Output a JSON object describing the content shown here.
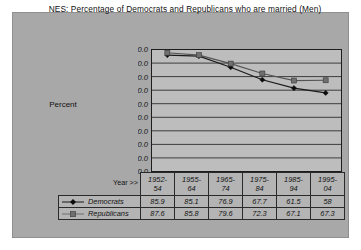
{
  "chart_data": {
    "type": "line",
    "title": "NES:  Percentage of Democrats and Republicans who are married (Men)",
    "xlabel": "Year >>",
    "ylabel": "Percent",
    "categories": [
      "1952-54",
      "1955-64",
      "1965-74",
      "1975-84",
      "1985-94",
      "1995-04"
    ],
    "category_lines": [
      [
        "1952-",
        "54"
      ],
      [
        "1955-",
        "64"
      ],
      [
        "1965-",
        "74"
      ],
      [
        "1975-",
        "84"
      ],
      [
        "1985-",
        "94"
      ],
      [
        "1995-",
        "04"
      ]
    ],
    "series": [
      {
        "name": "Democrats",
        "values": [
          85.9,
          85.1,
          76.9,
          67.7,
          61.5,
          58.0
        ],
        "color": "#1a1a1a",
        "marker": "diamond"
      },
      {
        "name": "Republicans",
        "values": [
          87.6,
          85.8,
          79.6,
          72.3,
          67.1,
          67.3
        ],
        "color": "#6f6f6f",
        "marker": "square"
      }
    ],
    "ylim": [
      0.0,
      90.0
    ],
    "ytick_step": 10.0,
    "yticks": [
      "90.0",
      "80.0",
      "70.0",
      "60.0",
      "50.0",
      "40.0",
      "30.0",
      "20.0",
      "10.0",
      "0.0"
    ],
    "grid": true,
    "legend_position": "data-table-left"
  },
  "colors": {
    "panel_background": "#a8a8a8",
    "plot_background": "#bdbdbd",
    "table_background": "#b4b4b4",
    "gridline": "#1d1d1d",
    "page_background": "#ffffff"
  }
}
